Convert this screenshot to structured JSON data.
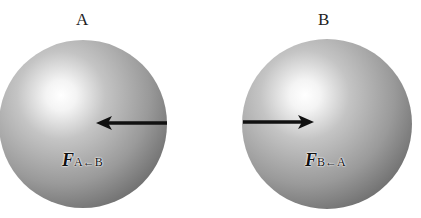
{
  "diagram": {
    "spheres": [
      {
        "label": "A",
        "force_symbol": "F",
        "force_subscript": "A←B",
        "arrow_direction": "left"
      },
      {
        "label": "B",
        "force_symbol": "F",
        "force_subscript": "B←A",
        "arrow_direction": "right"
      }
    ],
    "colors": {
      "sphere_highlight": "#ffffff",
      "sphere_shadow": "#6a6a6a",
      "arrow": "#111111"
    }
  }
}
